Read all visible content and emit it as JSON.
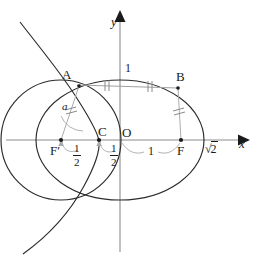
{
  "figure": {
    "width": 258,
    "height": 265,
    "background": "#ffffff"
  },
  "axes": {
    "x_label": "x",
    "y_label": "y",
    "origin_label": "O",
    "axis_color": "#8c8c8c",
    "arrow_color": "#1a1a1a"
  },
  "points": [
    {
      "id": "A",
      "label": "A",
      "x": -0.62,
      "y": 0.78
    },
    {
      "id": "B",
      "label": "B",
      "x": 0.7,
      "y": 0.72
    },
    {
      "id": "C",
      "label": "C",
      "x": -0.25,
      "y": 0.0
    },
    {
      "id": "O",
      "label": "O",
      "x": 0.0,
      "y": 0.0
    },
    {
      "id": "F2",
      "label": "F′",
      "x": -0.7,
      "y": 0.0
    },
    {
      "id": "F1",
      "label": "F",
      "x": 0.7,
      "y": 0.0
    }
  ],
  "measurements": [
    {
      "id": "ab-chord",
      "label": "1",
      "kind": "segment-length",
      "note": "chord AB, ticked into two equal halves"
    },
    {
      "id": "f2-c",
      "label": "1/2",
      "numerator": "1",
      "denominator": "2",
      "kind": "fraction"
    },
    {
      "id": "c-o",
      "label": "1/2",
      "numerator": "1",
      "denominator": "2",
      "kind": "fraction"
    },
    {
      "id": "o-f",
      "label": "1",
      "kind": "segment-length"
    },
    {
      "id": "x-intercept",
      "label": "√2",
      "radicand": "2",
      "kind": "radical"
    }
  ],
  "angle": {
    "id": "alpha",
    "label": "a",
    "at": "F′",
    "between": [
      "F′A",
      "F′C"
    ]
  },
  "curves": [
    {
      "id": "ellipse",
      "type": "ellipse",
      "center": [
        0,
        0
      ],
      "semi_major": 1.414,
      "semi_minor": 1.0,
      "color": "#1a1a1a"
    },
    {
      "id": "circle",
      "type": "circle",
      "center": [
        -0.7,
        0
      ],
      "radius": 1.0,
      "color": "#1a1a1a"
    },
    {
      "id": "branch",
      "type": "conic-branch",
      "opens": "left",
      "color": "#1a1a1a"
    }
  ],
  "tick_marks": [
    {
      "id": "tick-ab-left",
      "count": 2,
      "on": "AB left half"
    },
    {
      "id": "tick-ab-right",
      "count": 2,
      "on": "AB right half"
    },
    {
      "id": "tick-f2a",
      "count": 2,
      "on": "F′A"
    },
    {
      "id": "tick-bf",
      "count": 2,
      "on": "BF"
    }
  ],
  "colors": {
    "ink": "#1a1a1a",
    "axis": "#8c8c8c",
    "helper": "#a8a8a8",
    "chord": "#9a9a9a"
  }
}
